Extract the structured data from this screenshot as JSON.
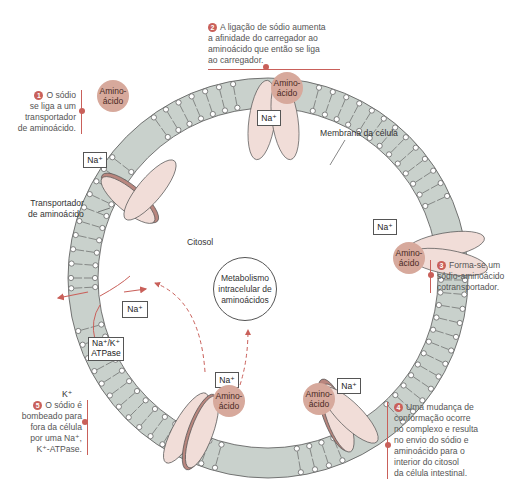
{
  "diagram": {
    "colors": {
      "membrane_fill": "#c9d1cc",
      "membrane_stroke": "#555555",
      "protein_fill": "#f1ddd8",
      "protein_dark": "#b9867e",
      "amino_acid": "#d7a99c",
      "accent": "#c9605a",
      "arrow": "#c9605a"
    },
    "labels": {
      "membrane": "Membrana da célula",
      "cytosol": "Citosol",
      "transporter_line1": "Transportador",
      "transporter_line2": "de aminoácido",
      "metabolism_line1": "Metabolismo",
      "metabolism_line2": "intracelular de",
      "metabolism_line3": "aminoácidos",
      "k_ion": "K⁺"
    },
    "ions": {
      "na": "Na⁺",
      "pump_line1": "Na⁺/K⁺",
      "pump_line2": "ATPase"
    },
    "amino_acid": {
      "line1": "Amino-",
      "line2": "ácido"
    },
    "steps": [
      {
        "num": "1",
        "text_lines": [
          "O sódio",
          "se liga a um",
          "transportador",
          "de aminoácido."
        ]
      },
      {
        "num": "2",
        "text_lines": [
          "A ligação de sódio aumenta",
          "a afinidade do carregador ao",
          "aminoácido que então se liga",
          "ao carregador."
        ]
      },
      {
        "num": "3",
        "text_lines": [
          "Forma-se um",
          "sódio-aminoácido",
          "cotransportador."
        ]
      },
      {
        "num": "4",
        "text_lines": [
          "Uma mudança de",
          "conformação ocorre",
          "no complexo e resulta",
          "no envio do sódio e",
          "aminoácido para o",
          "interior do citosol",
          "da célula intestinal."
        ]
      },
      {
        "num": "5",
        "text_lines": [
          "O sódio é",
          "bombeado para",
          "fora da célula",
          "por uma Na⁺,",
          "K⁺-ATPase."
        ]
      }
    ]
  }
}
